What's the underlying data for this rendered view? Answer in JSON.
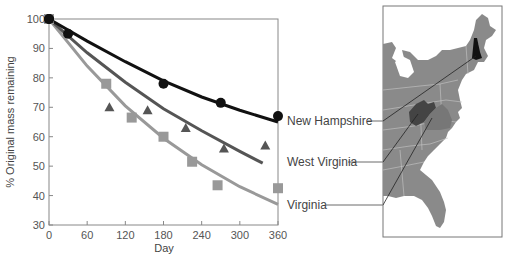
{
  "chart_data": {
    "type": "scatter",
    "title": "",
    "xlabel": "Day",
    "ylabel": "% Original mass remaining",
    "xlim": [
      0,
      360
    ],
    "ylim": [
      30,
      100
    ],
    "xticks": [
      0,
      60,
      120,
      180,
      240,
      300,
      360
    ],
    "yticks": [
      30,
      40,
      50,
      60,
      70,
      80,
      90,
      100
    ],
    "grid": false,
    "legend_position": "right (labels linked to map)",
    "series": [
      {
        "name": "New Hampshire",
        "marker": "circle",
        "color": "#111111",
        "points": [
          [
            0,
            100
          ],
          [
            30,
            95
          ],
          [
            180,
            78
          ],
          [
            270,
            71.5
          ],
          [
            360,
            67
          ]
        ],
        "fit_curve": [
          [
            0,
            100
          ],
          [
            60,
            92.5
          ],
          [
            120,
            85.5
          ],
          [
            180,
            79
          ],
          [
            240,
            73.5
          ],
          [
            300,
            69
          ],
          [
            360,
            65
          ]
        ]
      },
      {
        "name": "West Virginia",
        "marker": "triangle",
        "color": "#555555",
        "points": [
          [
            0,
            100
          ],
          [
            95,
            70
          ],
          [
            155,
            69
          ],
          [
            215,
            63
          ],
          [
            275,
            56
          ],
          [
            340,
            57
          ]
        ],
        "fit_curve": [
          [
            0,
            100
          ],
          [
            60,
            88.5
          ],
          [
            120,
            78.5
          ],
          [
            180,
            69.5
          ],
          [
            240,
            62
          ],
          [
            300,
            55
          ],
          [
            336,
            51
          ]
        ]
      },
      {
        "name": "Virginia",
        "marker": "square",
        "color": "#999999",
        "points": [
          [
            0,
            100
          ],
          [
            90,
            78
          ],
          [
            130,
            66.5
          ],
          [
            180,
            60
          ],
          [
            225,
            51.5
          ],
          [
            265,
            43.5
          ],
          [
            360,
            42.5
          ]
        ],
        "fit_curve": [
          [
            0,
            100
          ],
          [
            60,
            84
          ],
          [
            120,
            70.5
          ],
          [
            180,
            59.5
          ],
          [
            240,
            50.5
          ],
          [
            300,
            43
          ],
          [
            360,
            37
          ]
        ]
      }
    ]
  },
  "map": {
    "title": "Eastern United States",
    "highlighted_states": [
      {
        "name": "New Hampshire",
        "fill": "#111111"
      },
      {
        "name": "West Virginia",
        "fill": "#444444"
      },
      {
        "name": "Virginia",
        "fill": "#777777"
      }
    ],
    "base_fill": "#8a8a8a"
  },
  "labels": {
    "nh": "New Hampshire",
    "wv": "West Virginia",
    "va": "Virginia"
  }
}
